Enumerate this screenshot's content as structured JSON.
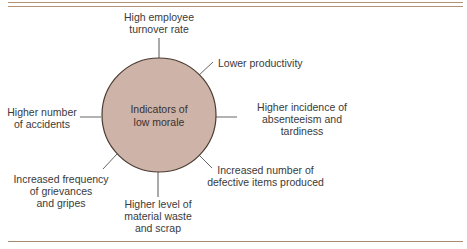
{
  "diagram": {
    "center": {
      "line1": "Indicators of",
      "line2": "low morale",
      "fill": "#cdb3a8",
      "stroke": "#4a3a30"
    },
    "rule_color": "#b08e72",
    "indicators": [
      {
        "id": "turnover",
        "lines": [
          "High employee",
          "turnover rate"
        ]
      },
      {
        "id": "productivity",
        "lines": [
          "Lower productivity"
        ]
      },
      {
        "id": "absenteeism",
        "lines": [
          "Higher incidence of",
          "absenteeism and",
          "tardiness"
        ]
      },
      {
        "id": "defective",
        "lines": [
          "Increased number of",
          "defective items produced"
        ]
      },
      {
        "id": "waste",
        "lines": [
          "Higher level of",
          "material waste",
          "and scrap"
        ]
      },
      {
        "id": "grievances",
        "lines": [
          "Increased frequency",
          "of grievances",
          "and gripes"
        ]
      },
      {
        "id": "accidents",
        "lines": [
          "Higher number",
          "of accidents"
        ]
      }
    ]
  }
}
